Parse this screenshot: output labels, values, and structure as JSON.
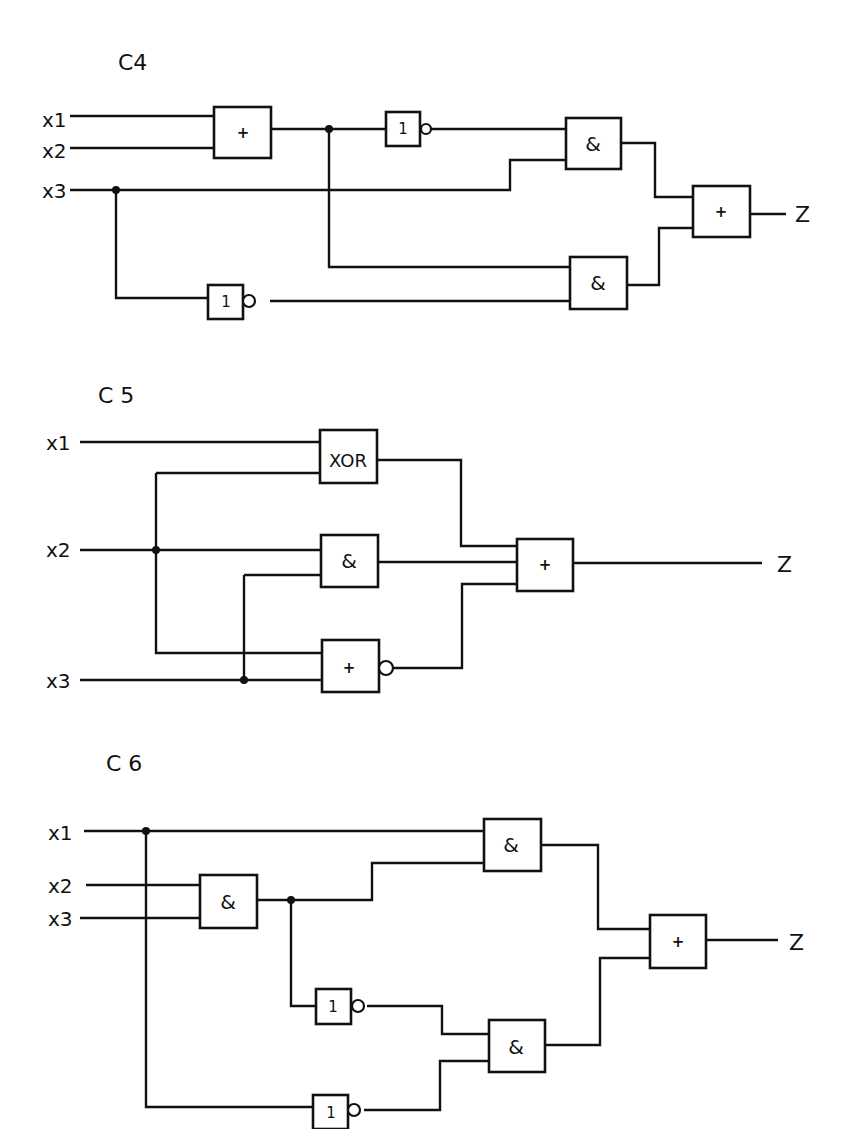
{
  "header": {
    "running_head": "J. Kunze et al."
  },
  "circuits": [
    {
      "id": "C4",
      "title": "C4",
      "inputs": [
        "x1",
        "x2",
        "x3"
      ],
      "output": "Z",
      "gates": [
        {
          "name": "or-1",
          "symbol": "+"
        },
        {
          "name": "not-1",
          "symbol": "1"
        },
        {
          "name": "and-1",
          "symbol": "&"
        },
        {
          "name": "and-2",
          "symbol": "&"
        },
        {
          "name": "not-2",
          "symbol": "1"
        },
        {
          "name": "or-out",
          "symbol": "+"
        }
      ]
    },
    {
      "id": "C5",
      "title": "C 5",
      "inputs": [
        "x1",
        "x2",
        "x3"
      ],
      "output": "Z",
      "gates": [
        {
          "name": "xor-1",
          "symbol": "XOR"
        },
        {
          "name": "and-1",
          "symbol": "&"
        },
        {
          "name": "nor-1",
          "symbol": "+"
        },
        {
          "name": "or-out",
          "symbol": "+"
        }
      ]
    },
    {
      "id": "C6",
      "title": "C 6",
      "inputs": [
        "x1",
        "x2",
        "x3"
      ],
      "output": "Z",
      "gates": [
        {
          "name": "and-in",
          "symbol": "&"
        },
        {
          "name": "and-1",
          "symbol": "&"
        },
        {
          "name": "not-1",
          "symbol": "1"
        },
        {
          "name": "not-2",
          "symbol": "1"
        },
        {
          "name": "and-2",
          "symbol": "&"
        },
        {
          "name": "or-out",
          "symbol": "+"
        }
      ]
    }
  ]
}
